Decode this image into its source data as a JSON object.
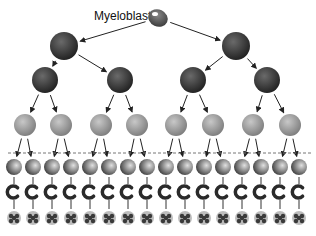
{
  "diagram": {
    "title_label": "Myeloblast",
    "type": "cell-lineage-tree",
    "levels": [
      {
        "name": "myeloblast",
        "count": 1,
        "y": 18,
        "r": 10,
        "color": "#555555",
        "x": [
          158
        ]
      },
      {
        "name": "generation-2",
        "count": 2,
        "y": 46,
        "r": 14,
        "color": "#3a3a3a",
        "x": [
          64,
          236
        ]
      },
      {
        "name": "generation-3",
        "count": 4,
        "y": 80,
        "r": 13,
        "color": "#333333",
        "x": [
          45,
          120,
          193,
          267
        ]
      },
      {
        "name": "generation-4",
        "count": 8,
        "y": 125,
        "r": 11,
        "color": "#9a9a9a",
        "x": [
          25,
          61,
          101,
          137,
          176,
          213,
          253,
          290
        ]
      },
      {
        "name": "generation-5",
        "count": 16,
        "y": 167,
        "r": 8,
        "color": "#6a6a6a"
      },
      {
        "name": "generation-6",
        "count": 16,
        "y": 192,
        "r": 6,
        "color": "#2a2a2a"
      },
      {
        "name": "generation-7",
        "count": 16,
        "y": 218,
        "r": 7,
        "color": "#3a3a3a"
      }
    ],
    "divider": {
      "style": "dashed",
      "y": 153,
      "color": "#777777"
    },
    "columns_x": [
      14,
      33,
      52,
      71,
      90,
      109,
      128,
      147,
      166,
      185,
      204,
      223,
      242,
      261,
      280,
      299
    ]
  }
}
